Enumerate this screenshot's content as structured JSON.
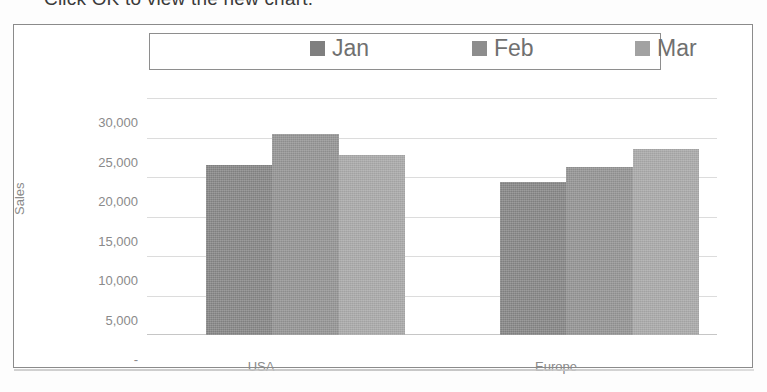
{
  "caption": {
    "text": "Click OK to view the new chart."
  },
  "chart": {
    "legend": {
      "position": "top",
      "entries": [
        {
          "label": "Jan",
          "color": "#7f7f7f"
        },
        {
          "label": "Feb",
          "color": "#8d8d8d"
        },
        {
          "label": "Mar",
          "color": "#a2a2a2"
        }
      ]
    },
    "yaxis": {
      "title": "Sales",
      "ticks": [
        "30,000",
        "25,000",
        "20,000",
        "15,000",
        "10,000",
        "5,000",
        "-"
      ]
    },
    "xaxis": {
      "categories": [
        "USA",
        "Europe"
      ]
    }
  },
  "chart_data": {
    "type": "bar",
    "title": "",
    "xlabel": "",
    "ylabel": "Sales",
    "categories": [
      "USA",
      "Europe"
    ],
    "series": [
      {
        "name": "Jan",
        "values": [
          21600,
          19400
        ],
        "color": "#7f7f7f"
      },
      {
        "name": "Feb",
        "values": [
          25500,
          21300
        ],
        "color": "#8d8d8d"
      },
      {
        "name": "Mar",
        "values": [
          22900,
          23700
        ],
        "color": "#a2a2a2"
      }
    ],
    "ylim": [
      0,
      30000
    ],
    "ytick_values": [
      0,
      5000,
      10000,
      15000,
      20000,
      25000,
      30000
    ],
    "ytick_labels": [
      "-",
      "5,000",
      "10,000",
      "15,000",
      "20,000",
      "25,000",
      "30,000"
    ],
    "grid": true,
    "legend_position": "top"
  }
}
